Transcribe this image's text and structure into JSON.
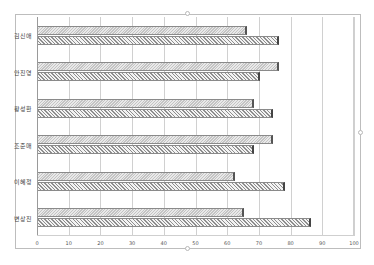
{
  "chart_data": {
    "type": "bar",
    "orientation": "horizontal",
    "title": "",
    "xlabel": "",
    "ylabel": "",
    "xlim": [
      0,
      100
    ],
    "x_ticks": [
      0,
      10,
      20,
      30,
      40,
      50,
      60,
      70,
      80,
      90,
      100
    ],
    "grid": true,
    "legend": "none",
    "categories": [
      "김신애",
      "안진영",
      "황성환",
      "조준매",
      "이혜정",
      "변상진"
    ],
    "series": [
      {
        "name": "series1",
        "pattern": "light-dotted-hatch",
        "values": [
          66,
          76,
          68,
          74,
          62,
          65
        ]
      },
      {
        "name": "series2",
        "pattern": "diagonal-hatch",
        "values": [
          76,
          70,
          74,
          68,
          78,
          86
        ]
      }
    ]
  },
  "colors": {
    "frame_border": "#bdbdbd",
    "gridline": "#d0d0d0",
    "series1_fill": "#d6d6d6",
    "series2_fill": "#a8a8a8",
    "bar_edge": "#555555"
  }
}
